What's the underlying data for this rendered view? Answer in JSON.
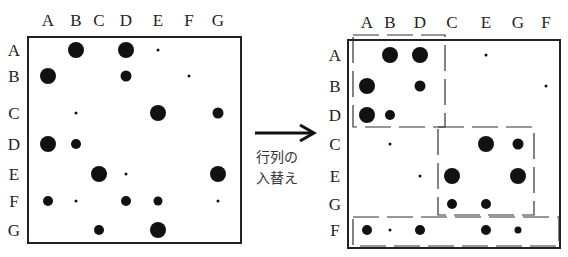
{
  "caption": {
    "line1": "行列の",
    "line2": "入替え"
  },
  "left_matrix": {
    "col_labels": [
      "A",
      "B",
      "C",
      "D",
      "E",
      "F",
      "G"
    ],
    "row_labels": [
      "A",
      "B",
      "C",
      "D",
      "E",
      "F",
      "G"
    ],
    "col_x": [
      48,
      76,
      99,
      126,
      158,
      189,
      218
    ],
    "row_y": [
      50,
      76,
      113,
      144,
      174,
      201,
      230
    ],
    "dots": [
      {
        "r": 0,
        "c": 1,
        "s": 8
      },
      {
        "r": 0,
        "c": 3,
        "s": 8
      },
      {
        "r": 0,
        "c": 4,
        "s": 1.5
      },
      {
        "r": 0,
        "c": 5,
        "s": 0
      },
      {
        "r": 1,
        "c": 0,
        "s": 8
      },
      {
        "r": 1,
        "c": 3,
        "s": 5.5
      },
      {
        "r": 1,
        "c": 5,
        "s": 1.5
      },
      {
        "r": 2,
        "c": 1,
        "s": 1.5
      },
      {
        "r": 2,
        "c": 4,
        "s": 8
      },
      {
        "r": 2,
        "c": 6,
        "s": 5.5
      },
      {
        "r": 3,
        "c": 0,
        "s": 8
      },
      {
        "r": 3,
        "c": 1,
        "s": 5
      },
      {
        "r": 4,
        "c": 2,
        "s": 8
      },
      {
        "r": 4,
        "c": 3,
        "s": 1.5
      },
      {
        "r": 4,
        "c": 6,
        "s": 8
      },
      {
        "r": 5,
        "c": 0,
        "s": 5
      },
      {
        "r": 5,
        "c": 1,
        "s": 1.5
      },
      {
        "r": 5,
        "c": 3,
        "s": 5
      },
      {
        "r": 5,
        "c": 4,
        "s": 4.5
      },
      {
        "r": 5,
        "c": 6,
        "s": 1.5
      },
      {
        "r": 6,
        "c": 2,
        "s": 5
      },
      {
        "r": 6,
        "c": 4,
        "s": 8
      }
    ]
  },
  "right_matrix": {
    "col_labels": [
      "A",
      "B",
      "D",
      "C",
      "E",
      "G",
      "F"
    ],
    "row_labels": [
      "A",
      "B",
      "D",
      "C",
      "E",
      "G",
      "F"
    ],
    "col_x": [
      367,
      390,
      420,
      452,
      486,
      518,
      546
    ],
    "row_y": [
      55,
      86,
      115,
      144,
      176,
      204,
      230
    ],
    "dots": [
      {
        "r": 0,
        "c": 1,
        "s": 8
      },
      {
        "r": 0,
        "c": 2,
        "s": 8
      },
      {
        "r": 0,
        "c": 4,
        "s": 1.5
      },
      {
        "r": 1,
        "c": 0,
        "s": 8
      },
      {
        "r": 1,
        "c": 2,
        "s": 5.5
      },
      {
        "r": 1,
        "c": 6,
        "s": 1.5
      },
      {
        "r": 2,
        "c": 0,
        "s": 8
      },
      {
        "r": 2,
        "c": 1,
        "s": 5
      },
      {
        "r": 3,
        "c": 1,
        "s": 1.5
      },
      {
        "r": 3,
        "c": 4,
        "s": 8
      },
      {
        "r": 3,
        "c": 5,
        "s": 5.5
      },
      {
        "r": 4,
        "c": 2,
        "s": 1.5
      },
      {
        "r": 4,
        "c": 3,
        "s": 8
      },
      {
        "r": 4,
        "c": 5,
        "s": 8
      },
      {
        "r": 5,
        "c": 3,
        "s": 5
      },
      {
        "r": 5,
        "c": 4,
        "s": 5
      },
      {
        "r": 6,
        "c": 0,
        "s": 5
      },
      {
        "r": 6,
        "c": 1,
        "s": 1.5
      },
      {
        "r": 6,
        "c": 2,
        "s": 5
      },
      {
        "r": 6,
        "c": 4,
        "s": 5
      },
      {
        "r": 6,
        "c": 5,
        "s": 3.5
      }
    ]
  }
}
